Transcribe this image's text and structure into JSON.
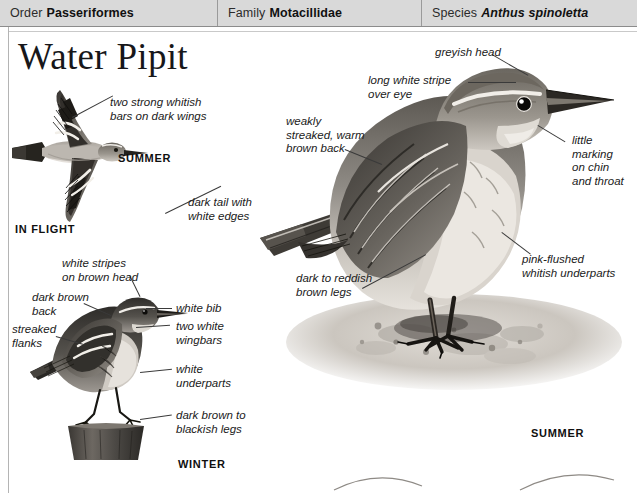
{
  "header": {
    "order": {
      "key": "Order",
      "value": "Passeriformes"
    },
    "family": {
      "key": "Family",
      "value": "Motacillidae"
    },
    "species": {
      "key": "Species",
      "value": "Anthus spinoletta"
    }
  },
  "title": "Water Pipit",
  "plates": {
    "flight": {
      "stage_label": "IN FLIGHT",
      "season_label": "SUMMER"
    },
    "winter": {
      "season_label": "WINTER"
    },
    "summer": {
      "season_label": "SUMMER"
    }
  },
  "annotations": {
    "flight_wingbars": "two strong whitish\nbars on dark wings",
    "flight_tail": "dark tail with\nwhite edges",
    "winter_head_stripes": "white stripes\non brown head",
    "winter_back": "dark brown\nback",
    "winter_flanks": "streaked\nflanks",
    "winter_bib": "white bib",
    "winter_wingbars": "two white\nwingbars",
    "winter_underparts": "white\nunderparts",
    "winter_legs": "dark brown to\nblackish legs",
    "summer_head": "greyish head",
    "summer_supercilium": "long white stripe\nover eye",
    "summer_back": "weakly\nstreaked, warm\nbrown back",
    "summer_chin": "little\nmarking\non chin\nand throat",
    "summer_underparts": "pink-flushed\nwhitish underparts",
    "summer_legs": "dark to reddish\nbrown legs"
  },
  "colors": {
    "header_bg": "#d9d9d9",
    "rule": "#b4b4b4",
    "text": "#1a1a1a",
    "leader": "#3a3a3a",
    "plumage_dark": "#4a4744",
    "plumage_mid": "#8c8883",
    "plumage_light": "#d5d1cb",
    "ground": "#cfcbc5"
  }
}
